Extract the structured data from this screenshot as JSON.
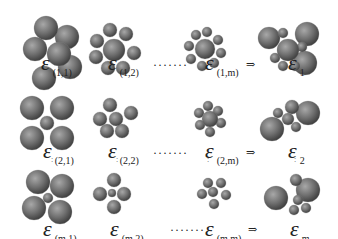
{
  "figure": {
    "rows": [
      {
        "cells": [
          {
            "eps": "ε",
            "sub": "(1,1)"
          },
          {
            "eps": "ε",
            "sub": "(1,2)"
          },
          {
            "eps": "ε",
            "sub": "(1,m)"
          }
        ],
        "dots": "·······",
        "arrow": "⇒",
        "result": {
          "eps": "ε",
          "sub": "1"
        }
      },
      {
        "cells": [
          {
            "eps": "ε",
            "sub": "(2,1)"
          },
          {
            "eps": "ε",
            "sub": "(2,2)"
          },
          {
            "eps": "ε",
            "sub": "(2,m)"
          }
        ],
        "dots": "·······",
        "arrow": "⇒",
        "result": {
          "eps": "ε",
          "sub": "2"
        }
      },
      {
        "cells": [
          {
            "eps": "ε",
            "sub": "(m,1)"
          },
          {
            "eps": "ε",
            "sub": "(m,2)"
          },
          {
            "eps": "ε",
            "sub": "(m,m)"
          }
        ],
        "dots": "·······",
        "arrow": "⇒",
        "result": {
          "eps": "ε",
          "sub": "m"
        }
      }
    ],
    "vdots": ":",
    "colors": {
      "sphere_light": "#9a9a9a",
      "sphere_dark": "#3c3c3c",
      "bond": "#888888"
    }
  }
}
